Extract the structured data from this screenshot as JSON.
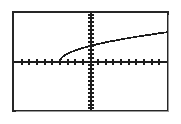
{
  "screen": {
    "device": "graphing-calculator-screen",
    "background_color": "#ffffff",
    "frame_color": "#262626",
    "ink_color": "#1c1c1c"
  },
  "chart_data": {
    "type": "line",
    "title": "",
    "subtitle": "",
    "xlabel": "",
    "ylabel": "",
    "legend": [],
    "legend_position": "none",
    "grid": false,
    "axes": {
      "x_axis_visible": true,
      "y_axis_visible": true,
      "x_axis_y_value": 0,
      "y_axis_x_value": 0,
      "ticks_visible": true,
      "tick_labels_visible": false,
      "x_tick_count": 20,
      "y_tick_count": 20,
      "x_tick_spacing": 1,
      "y_tick_spacing": 1
    },
    "xlim": [
      -10,
      10
    ],
    "ylim": [
      -6.2,
      6.2
    ],
    "series": [
      {
        "name": "y = sqrt(x + 4)",
        "style": "solid",
        "color": "#1c1c1c",
        "x": [
          -4.0,
          -3.8,
          -3.6,
          -3.4,
          -3.2,
          -3.0,
          -2.6,
          -2.2,
          -1.8,
          -1.4,
          -1.0,
          -0.5,
          0.0,
          0.8,
          1.6,
          2.4,
          3.2,
          4.0,
          5.0,
          6.0,
          7.0,
          8.0,
          9.0,
          10.0
        ],
        "y": [
          0.0,
          0.45,
          0.63,
          0.77,
          0.89,
          1.0,
          1.18,
          1.34,
          1.48,
          1.61,
          1.73,
          1.87,
          2.0,
          2.19,
          2.37,
          2.53,
          2.68,
          2.83,
          3.0,
          3.16,
          3.32,
          3.46,
          3.61,
          3.74
        ]
      }
    ],
    "annotations": [
      {
        "label": "x-intercept",
        "x": -4.0,
        "y": 0.0
      },
      {
        "label": "y-intercept",
        "x": 0.0,
        "y": 2.0
      }
    ]
  }
}
